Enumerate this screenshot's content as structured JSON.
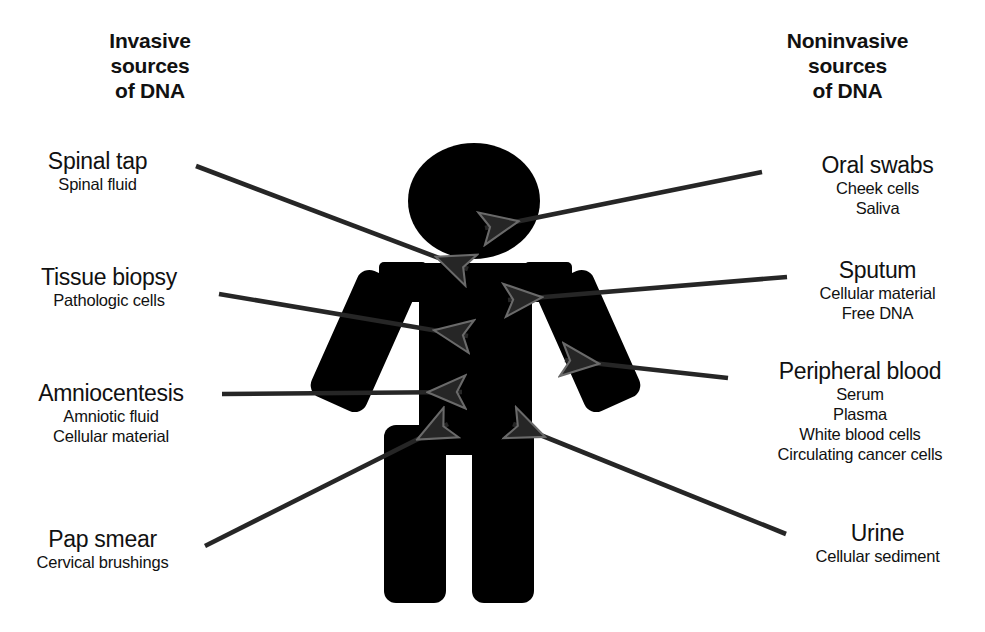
{
  "diagram": {
    "title_context": "Invasive and noninvasive sources of DNA",
    "figure_color": "#000000",
    "background_color": "#ffffff",
    "line_color": "#262626"
  },
  "columns": {
    "left": {
      "heading_line1": "Invasive",
      "heading_line2": "sources",
      "heading_line3": "of DNA"
    },
    "right": {
      "heading_line1": "Noninvasive",
      "heading_line2": "sources",
      "heading_line3": "of DNA"
    }
  },
  "invasive_sources": [
    {
      "name": "Spinal tap",
      "details": [
        "Spinal fluid"
      ]
    },
    {
      "name": "Tissue biopsy",
      "details": [
        "Pathologic cells"
      ]
    },
    {
      "name": "Amniocentesis",
      "details": [
        "Amniotic fluid",
        "Cellular material"
      ]
    },
    {
      "name": "Pap smear",
      "details": [
        "Cervical brushings"
      ]
    }
  ],
  "noninvasive_sources": [
    {
      "name": "Oral swabs",
      "details": [
        "Cheek cells",
        "Saliva"
      ]
    },
    {
      "name": "Sputum",
      "details": [
        "Cellular material",
        "Free DNA"
      ]
    },
    {
      "name": "Peripheral blood",
      "details": [
        "Serum",
        "Plasma",
        "White blood cells",
        "Circulating cancer cells"
      ]
    },
    {
      "name": "Urine",
      "details": [
        "Cellular sediment"
      ]
    }
  ],
  "figure": {
    "label": "human-body-silhouette",
    "parts": [
      "head",
      "left-shoulder",
      "right-shoulder",
      "torso",
      "left-arm",
      "right-arm",
      "left-leg",
      "right-leg"
    ]
  }
}
